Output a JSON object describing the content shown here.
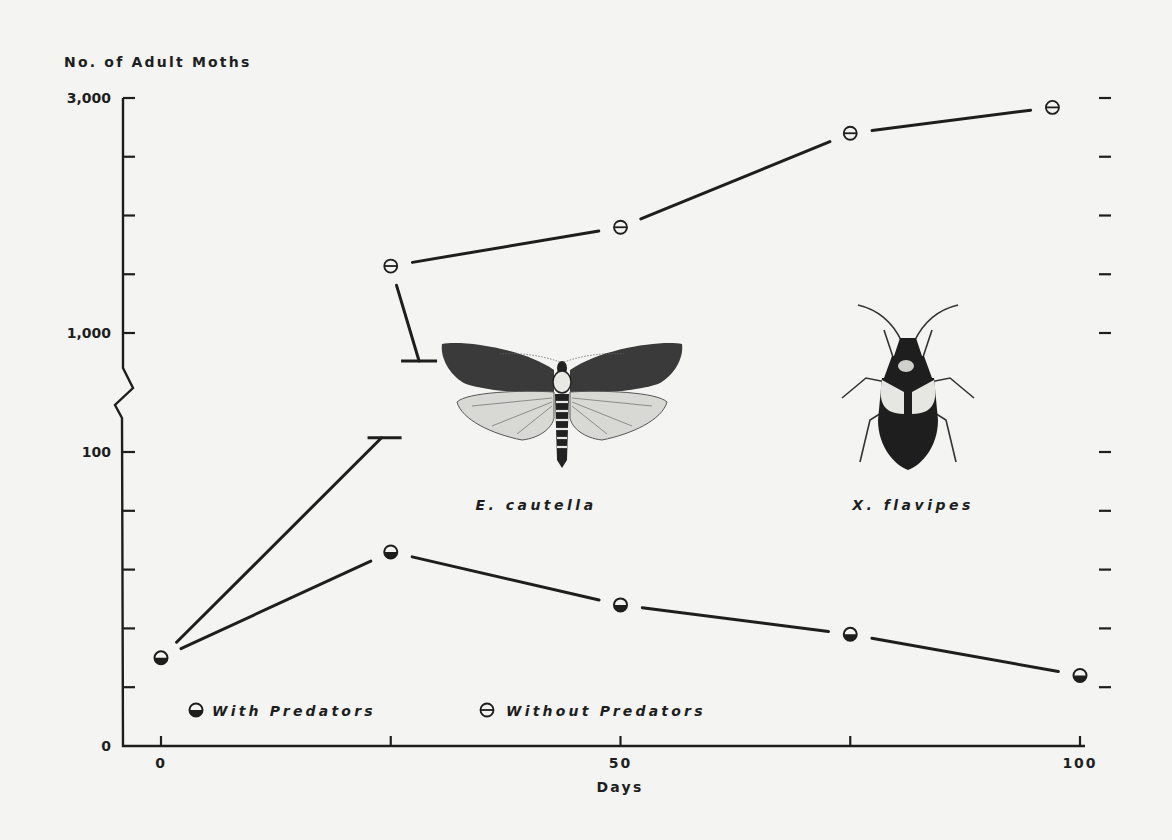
{
  "chart_data": {
    "type": "line",
    "title": "",
    "ylabel": "No. of Adult Moths",
    "xlabel": "Days",
    "x_ticks": [
      0,
      25,
      50,
      75,
      100
    ],
    "x_tick_labels": [
      "0",
      "",
      "50",
      "",
      "100"
    ],
    "xlim": [
      0,
      100
    ],
    "y_scale": "broken",
    "y_segments": [
      {
        "range": [
          0,
          100
        ],
        "ticks": [
          0,
          20,
          40,
          60,
          80,
          100
        ],
        "tick_labels": [
          "0",
          "",
          "",
          "",
          "",
          "100"
        ]
      },
      {
        "range": [
          1000,
          3000
        ],
        "ticks": [
          1000,
          1500,
          2000,
          2500,
          3000
        ],
        "tick_labels": [
          "1,000",
          "",
          "",
          "",
          "3,000"
        ]
      }
    ],
    "right_axis_ticks": "mirrors left ticks, unlabeled",
    "series": [
      {
        "name": "With Predators",
        "marker": "half-filled circle (bottom filled)",
        "points": [
          {
            "x": 0,
            "y": 30
          },
          {
            "x": 25,
            "y": 66
          },
          {
            "x": 50,
            "y": 48
          },
          {
            "x": 75,
            "y": 38
          },
          {
            "x": 100,
            "y": 24
          }
        ]
      },
      {
        "name": "Without Predators",
        "marker": "theta circle",
        "points": [
          {
            "x": 25,
            "y": 1570
          },
          {
            "x": 50,
            "y": 1900
          },
          {
            "x": 75,
            "y": 2700
          },
          {
            "x": 97,
            "y": 2920
          }
        ],
        "start_point": {
          "x": 0,
          "y": 30
        },
        "off_scale_segment": {
          "from_x": 0,
          "from_y": 30,
          "break_x": 24,
          "resume_x": 32,
          "note": "line exits lower scale above 100 and re-enters upper scale below 1,000"
        }
      }
    ],
    "legend": {
      "placement": "bottom-left",
      "entries": [
        "With Predators",
        "Without Predators"
      ]
    },
    "annotations": [
      {
        "text": "E. cautella",
        "illustration": "moth"
      },
      {
        "text": "X. flavipes",
        "illustration": "predatory bug"
      }
    ],
    "grid": false
  },
  "labels": {
    "y_title": "No. of Adult Moths",
    "x_title": "Days",
    "moth_caption": "E. cautella",
    "bug_caption": "X. flavipes",
    "legend_with": "With Predators",
    "legend_without": "Without Predators"
  },
  "colors": {
    "ink": "#1e1e1e",
    "paper": "#f4f4f2"
  }
}
